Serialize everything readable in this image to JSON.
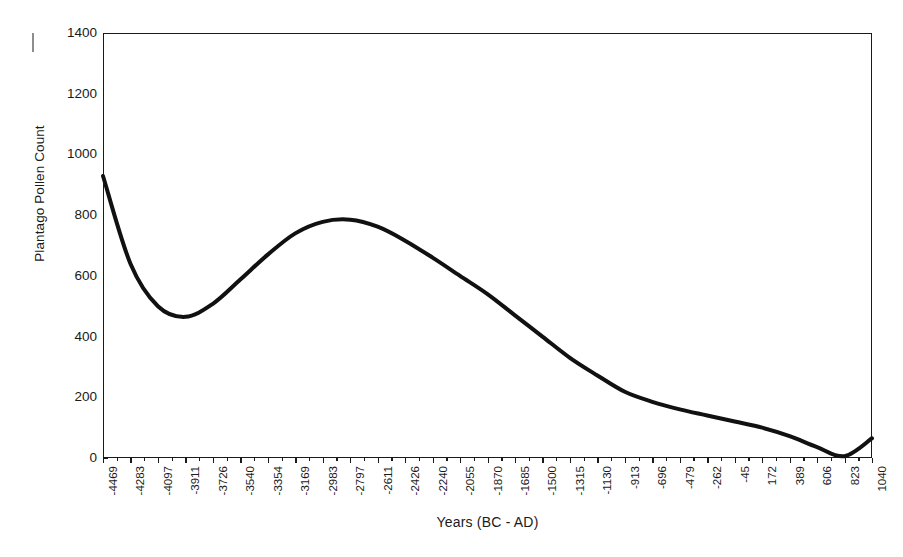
{
  "chart_data": {
    "type": "line",
    "title": "",
    "xlabel": "Years (BC - AD)",
    "ylabel": "Plantago Pollen Count",
    "grid": false,
    "legend": "none",
    "ylim": [
      0,
      1400
    ],
    "ytick_step": 200,
    "yticks": [
      0,
      200,
      400,
      600,
      800,
      1000,
      1200,
      1400
    ],
    "xtick_labels": [
      "-4469",
      "-4283",
      "-4097",
      "-3911",
      "-3726",
      "-3540",
      "-3354",
      "-3169",
      "-2983",
      "-2797",
      "-2611",
      "-2426",
      "-2240",
      "-2055",
      "-1870",
      "-1685",
      "-1500",
      "-1315",
      "-1130",
      "-913",
      "-696",
      "-479",
      "-262",
      "-45",
      "172",
      "389",
      "606",
      "823",
      "1040"
    ],
    "x": [
      -4469,
      -4283,
      -4097,
      -3911,
      -3726,
      -3540,
      -3354,
      -3169,
      -2983,
      -2797,
      -2611,
      -2426,
      -2240,
      -2055,
      -1870,
      -1685,
      -1500,
      -1315,
      -1130,
      -913,
      -696,
      -479,
      -262,
      -45,
      172,
      389,
      606,
      823,
      1040
    ],
    "values": [
      929,
      640,
      500,
      465,
      508,
      588,
      670,
      740,
      778,
      785,
      762,
      716,
      660,
      600,
      540,
      470,
      400,
      330,
      272,
      218,
      185,
      160,
      140,
      120,
      100,
      72,
      36,
      6,
      65
    ],
    "series": [
      {
        "name": "Plantago Pollen Count",
        "color": "#111111",
        "line_width": 4,
        "values": [
          929,
          640,
          500,
          465,
          508,
          588,
          670,
          740,
          778,
          785,
          762,
          716,
          660,
          600,
          540,
          470,
          400,
          330,
          272,
          218,
          185,
          160,
          140,
          120,
          100,
          72,
          36,
          6,
          65
        ]
      }
    ],
    "annotations": {
      "start_value": 929,
      "local_minimum": {
        "x": -3911,
        "y": 465
      },
      "peak": {
        "x": -2797,
        "y": 785
      },
      "final_minimum": {
        "x": 823,
        "y": 6
      },
      "end_value": 65
    }
  },
  "colors": {
    "line": "#111111",
    "axis": "#1a1a1a",
    "background": "#ffffff",
    "stray_mark": "#8d8d8d"
  }
}
